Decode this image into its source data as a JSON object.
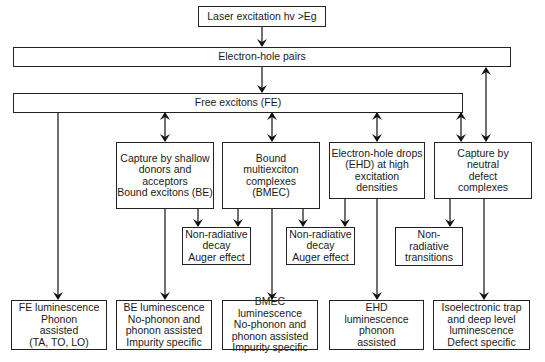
{
  "diagram": {
    "nodes": {
      "laser": "Laser excitation hv >Eg",
      "eh_pairs": "Electron-hole pairs",
      "free_excitons": "Free excitons (FE)",
      "capture_shallow": "Capture by shallow\ndonors and\nacceptors\nBound excitons (BE)",
      "bmec": "Bound\nmultiexciton\ncomplexes\n(BMEC)",
      "ehd": "Electron-hole drops\n(EHD) at high\nexcitation\ndensities",
      "capture_neutral": "Capture by\nneutral\ndefect\ncomplexes",
      "nonrad_1": "Non-radiative\ndecay\nAuger effect",
      "nonrad_2": "Non-radiative\ndecay\nAuger effect",
      "nonrad_3": "Non-\nradiative\ntransitions",
      "fe_lum": "FE luminescence\nPhonon\nassisted\n(TA, TO, LO)",
      "be_lum": "BE luminescence\nNo-phonon and\nphonon assisted\nImpurity specific",
      "bmec_lum": "BMEC luminescence\nNo-phonon and\nphonon assisted\nImpurity specific",
      "ehd_lum": "EHD\nluminescence\nphonon\nassisted",
      "iso_lum": "Isoelectronic trap\nand deep level\nluminescence\nDefect specific"
    },
    "edges": [
      {
        "from": "laser",
        "to": "eh_pairs",
        "type": "arrow"
      },
      {
        "from": "eh_pairs",
        "to": "free_excitons",
        "type": "arrow"
      },
      {
        "from": "eh_pairs",
        "to": "capture_neutral",
        "type": "double-arrow"
      },
      {
        "from": "free_excitons",
        "to": "fe_lum",
        "type": "arrow"
      },
      {
        "from": "free_excitons",
        "to": "capture_shallow",
        "type": "double-arrow"
      },
      {
        "from": "free_excitons",
        "to": "bmec",
        "type": "double-arrow"
      },
      {
        "from": "free_excitons",
        "to": "ehd",
        "type": "double-arrow"
      },
      {
        "from": "free_excitons",
        "to": "capture_neutral",
        "type": "double-arrow"
      },
      {
        "from": "capture_shallow",
        "to": "nonrad_1",
        "type": "arrow"
      },
      {
        "from": "capture_shallow",
        "to": "be_lum",
        "type": "arrow"
      },
      {
        "from": "bmec",
        "to": "nonrad_1",
        "type": "arrow"
      },
      {
        "from": "bmec",
        "to": "nonrad_2",
        "type": "arrow"
      },
      {
        "from": "bmec",
        "to": "bmec_lum",
        "type": "arrow"
      },
      {
        "from": "ehd",
        "to": "nonrad_2",
        "type": "arrow"
      },
      {
        "from": "ehd",
        "to": "ehd_lum",
        "type": "arrow"
      },
      {
        "from": "capture_neutral",
        "to": "nonrad_3",
        "type": "arrow"
      },
      {
        "from": "capture_neutral",
        "to": "iso_lum",
        "type": "arrow"
      }
    ]
  }
}
